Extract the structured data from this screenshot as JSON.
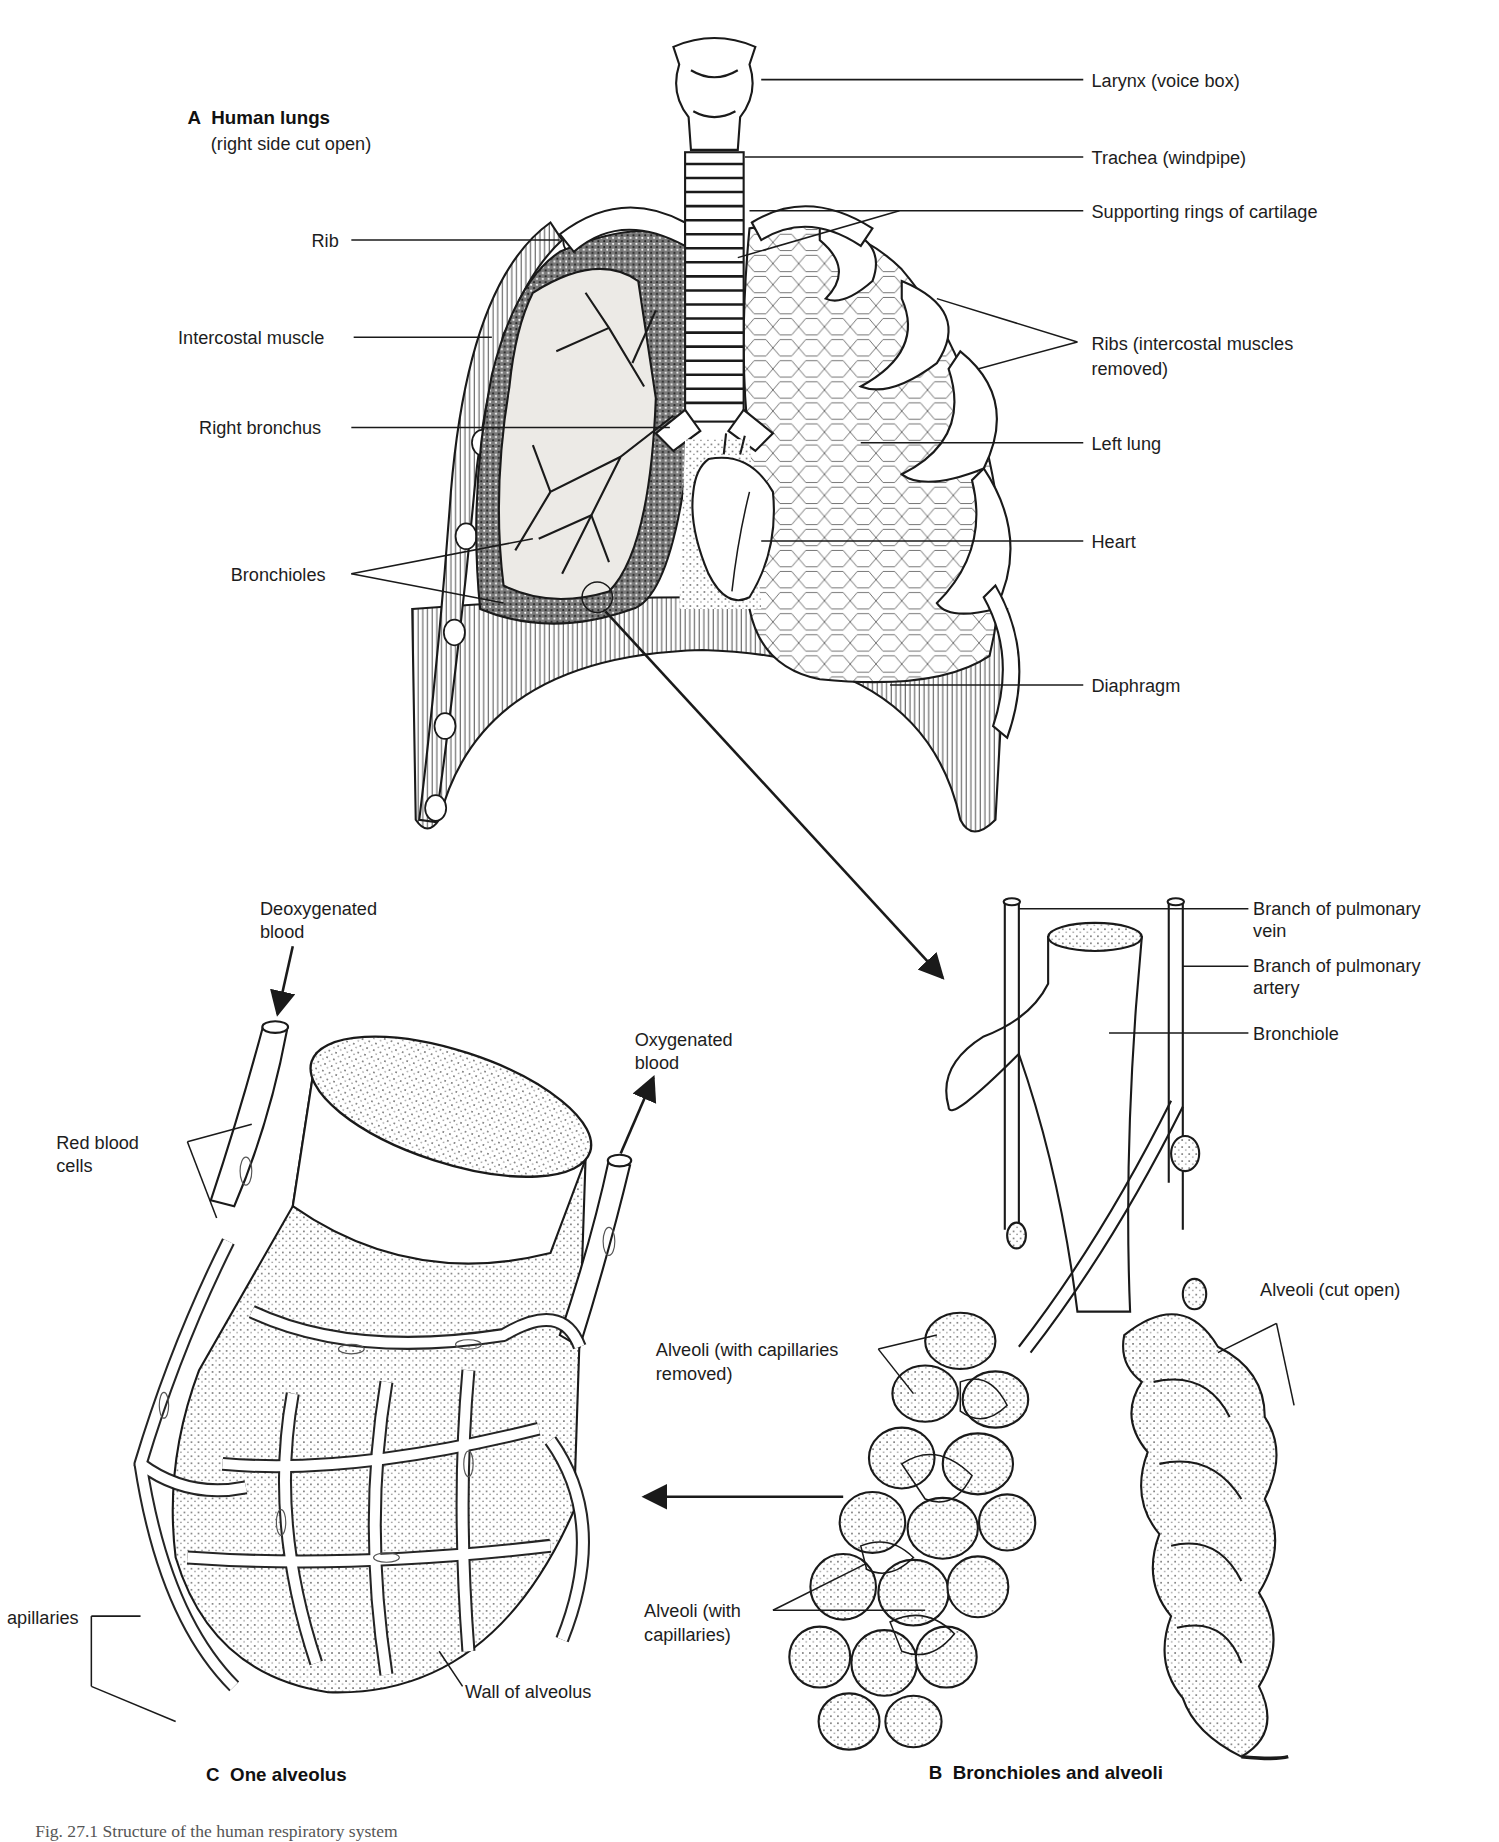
{
  "figure": {
    "caption_partial": "Fig. 27.1   Structure of the human respiratory system",
    "panels": [
      {
        "id": "A",
        "letter": "A",
        "title": "Human lungs",
        "subtitle": "(right side cut open)",
        "labels": [
          {
            "key": "larynx",
            "text": "Larynx (voice box)"
          },
          {
            "key": "trachea",
            "text": "Trachea (windpipe)"
          },
          {
            "key": "cartilage",
            "text": "Supporting rings of cartilage"
          },
          {
            "key": "rib",
            "text": "Rib"
          },
          {
            "key": "ribs",
            "text": "Ribs (intercostal muscles removed)",
            "line1": "Ribs (intercostal muscles",
            "line2": "removed)"
          },
          {
            "key": "intercostal",
            "text": "Intercostal muscle"
          },
          {
            "key": "right_bronchus",
            "text": "Right bronchus"
          },
          {
            "key": "left_lung",
            "text": "Left lung"
          },
          {
            "key": "heart",
            "text": "Heart"
          },
          {
            "key": "bronchioles",
            "text": "Bronchioles"
          },
          {
            "key": "diaphragm",
            "text": "Diaphragm"
          }
        ]
      },
      {
        "id": "B",
        "letter": "B",
        "title": "Bronchioles and alveoli",
        "labels": [
          {
            "key": "vein",
            "line1": "Branch of pulmonary",
            "line2": "vein"
          },
          {
            "key": "artery",
            "line1": "Branch of pulmonary",
            "line2": "artery"
          },
          {
            "key": "bronchiole",
            "text": "Bronchiole"
          },
          {
            "key": "alveoli_cut",
            "text": "Alveoli (cut open)"
          },
          {
            "key": "alveoli_removed",
            "line1": "Alveoli (with capillaries",
            "line2": "removed)"
          },
          {
            "key": "alveoli_with",
            "line1": "Alveoli (with",
            "line2": "capillaries)"
          }
        ]
      },
      {
        "id": "C",
        "letter": "C",
        "title": "One alveolus",
        "labels": [
          {
            "key": "deoxy",
            "line1": "Deoxygenated",
            "line2": "blood"
          },
          {
            "key": "oxy",
            "line1": "Oxygenated",
            "line2": "blood"
          },
          {
            "key": "rbc",
            "line1": "Red blood",
            "line2": "cells"
          },
          {
            "key": "capillaries",
            "text": "apillaries"
          },
          {
            "key": "wall",
            "text": "Wall of alveolus"
          }
        ]
      }
    ]
  }
}
